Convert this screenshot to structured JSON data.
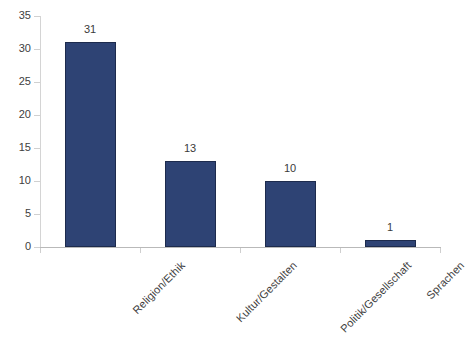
{
  "chart_data": {
    "type": "bar",
    "title": "",
    "subtitle": "",
    "xlabel": "",
    "ylabel": "",
    "categories": [
      "Religion/Ethik",
      "Kultur/Gestalten",
      "Politik/Gesellschaft",
      "Sprachen"
    ],
    "values": [
      31,
      13,
      10,
      1
    ],
    "value_labels": [
      "31",
      "13",
      "10",
      "1"
    ],
    "ylim": [
      0,
      35
    ],
    "yticks": [
      0,
      5,
      10,
      15,
      20,
      25,
      30,
      35
    ],
    "ytick_labels": [
      "0",
      "5",
      "10",
      "15",
      "20",
      "25",
      "30",
      "35"
    ],
    "grid": false,
    "legend": null,
    "legend_position": "none",
    "series": [
      {
        "name": "Anzahl",
        "values": [
          31,
          13,
          10,
          1
        ],
        "color": "#2e4374"
      }
    ],
    "colors": {
      "bar_fill": "#2e4374",
      "bar_border": "#1d2b4d",
      "axis_line": "#b9b9b9",
      "tick": "#d0d0d0",
      "text": "#3d3d3d",
      "background": "#ffffff"
    }
  }
}
